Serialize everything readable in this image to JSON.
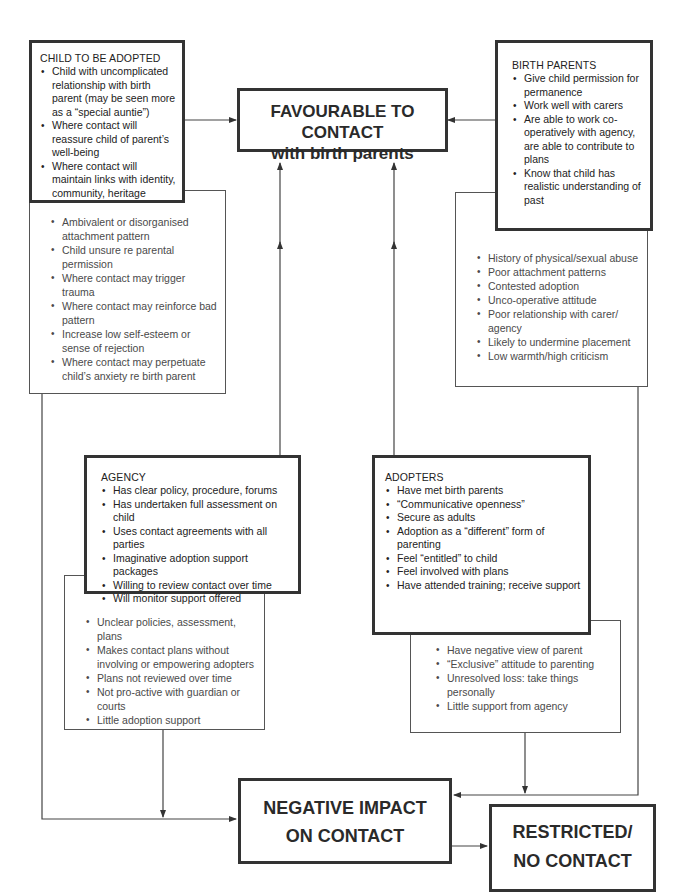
{
  "outcomes": {
    "favourable": {
      "line1": "FAVOURABLE TO CONTACT",
      "line2": "with birth parents"
    },
    "negative": {
      "line1": "NEGATIVE IMPACT",
      "line2": "ON CONTACT"
    },
    "restricted": {
      "line1": "RESTRICTED/",
      "line2": "NO CONTACT"
    }
  },
  "child": {
    "heading": "CHILD TO BE ADOPTED",
    "positive": [
      "Child with uncomplicated relationship with birth parent (may be seen more as a “special auntie”)",
      "Where contact will reassure child of parent’s well-being",
      "Where contact will maintain links with identity, community, heritage"
    ],
    "negative": [
      "Ambivalent or disorganised attachment pattern",
      "Child unsure re parental permission",
      "Where contact may trigger trauma",
      "Where contact may reinforce bad pattern",
      "Increase low self-esteem or sense of rejection",
      "Where contact may perpetuate child’s anxiety re birth parent"
    ]
  },
  "birth_parents": {
    "heading": "BIRTH PARENTS",
    "positive": [
      "Give child permission for permanence",
      "Work well with carers",
      "Are able to work co-operatively with agency, are able to contribute to plans",
      "Know that child has realistic understanding of past"
    ],
    "negative": [
      "History of physical/sexual abuse",
      "Poor attachment patterns",
      "Contested adoption",
      "Unco-operative attitude",
      "Poor relationship with carer/ agency",
      "Likely to undermine placement",
      "Low warmth/high criticism"
    ]
  },
  "agency": {
    "heading": "AGENCY",
    "positive": [
      "Has clear policy, procedure, forums",
      "Has undertaken full assessment on child",
      "Uses contact agreements with all parties",
      "Imaginative adoption support packages",
      "Willing to review contact over time",
      "Will monitor support offered"
    ],
    "negative": [
      "Unclear policies, assessment, plans",
      "Makes contact plans without involving or empowering adopters",
      "Plans not reviewed over time",
      "Not pro-active with guardian or courts",
      "Little adoption support"
    ]
  },
  "adopters": {
    "heading": "ADOPTERS",
    "positive": [
      "Have met birth parents",
      "“Communicative openness”",
      "Secure as adults",
      "Adoption as a “different” form of parenting",
      "Feel “entitled” to child",
      "Feel involved with plans",
      "Have attended training; receive support"
    ],
    "negative": [
      "Have negative view of parent",
      "“Exclusive” attitude to parenting",
      "Unresolved loss: take things personally",
      "Little support from agency"
    ]
  }
}
